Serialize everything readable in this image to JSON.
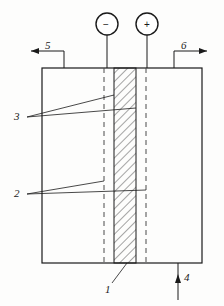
{
  "figure": {
    "type": "technical-line-diagram",
    "background_color": "#fdfdfc",
    "line_color": "#1a1a1a",
    "hatch_color": "#555555"
  },
  "terminals": {
    "negative": {
      "symbol": "−",
      "name": "cathode-terminal",
      "cx": 107,
      "cy": 24,
      "r": 11
    },
    "positive": {
      "symbol": "+",
      "name": "anode-terminal",
      "cx": 147,
      "cy": 24,
      "r": 11
    }
  },
  "callouts": [
    {
      "id": "1",
      "label": "1",
      "x": 107,
      "y": 288,
      "name": "callout-1-membrane"
    },
    {
      "id": "2",
      "label": "2",
      "x": 14,
      "y": 194,
      "name": "callout-2-electrode"
    },
    {
      "id": "3",
      "label": "3",
      "x": 14,
      "y": 117,
      "name": "callout-3-electrode"
    },
    {
      "id": "4",
      "label": "4",
      "x": 187,
      "y": 284,
      "name": "callout-4-outlet"
    },
    {
      "id": "5",
      "label": "5",
      "x": 45,
      "y": 47,
      "name": "callout-5-inlet-left"
    },
    {
      "id": "6",
      "label": "6",
      "x": 181,
      "y": 47,
      "name": "callout-6-inlet-right"
    }
  ],
  "vessel": {
    "name": "cell-vessel",
    "left": 42,
    "top": 68,
    "right": 202,
    "bottom": 263
  },
  "membrane": {
    "name": "ion-exchange-membrane",
    "left": 114,
    "right": 136,
    "top": 68,
    "bottom": 263,
    "fill": "diagonal-hatch"
  },
  "electrodes": [
    {
      "name": "cathode-plate",
      "x": 104,
      "top": 68,
      "bottom": 263,
      "style": "dashed"
    },
    {
      "name": "anode-plate",
      "x": 146,
      "top": 68,
      "bottom": 263,
      "style": "dashed"
    }
  ],
  "flows": [
    {
      "name": "flow-arrow-left",
      "direction": "left",
      "label": "5"
    },
    {
      "name": "flow-arrow-right",
      "direction": "right",
      "label": "6"
    },
    {
      "name": "flow-arrow-bottom",
      "direction": "up",
      "label": "4"
    }
  ]
}
